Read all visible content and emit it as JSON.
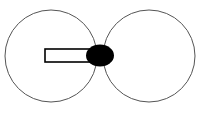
{
  "canvas": {
    "width": 203,
    "height": 114,
    "background": "#ffffff"
  },
  "diagram": {
    "circles": [
      {
        "name": "left-circle",
        "cx": 51,
        "cy": 56,
        "r": 46,
        "stroke": "#555555",
        "fill": "none"
      },
      {
        "name": "right-circle",
        "cx": 149,
        "cy": 56,
        "r": 46,
        "stroke": "#555555",
        "fill": "none"
      }
    ],
    "rectangle": {
      "x": 45,
      "y": 49,
      "width": 50,
      "height": 13,
      "stroke": "#000000",
      "fill": "#ffffff"
    },
    "ellipse": {
      "cx": 100,
      "cy": 55.5,
      "rx": 14,
      "ry": 11,
      "fill": "#000000"
    }
  }
}
